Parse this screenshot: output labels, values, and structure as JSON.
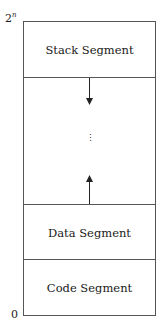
{
  "diagram": {
    "title": "",
    "axis": {
      "top_label_base": "2",
      "top_label_exp": "n",
      "bottom_label": "0"
    },
    "segments": [
      {
        "id": "stack",
        "label": "Stack Segment"
      },
      {
        "id": "free",
        "label": ""
      },
      {
        "id": "data",
        "label": "Data Segment"
      },
      {
        "id": "code",
        "label": "Code Segment"
      }
    ],
    "arrows": [
      {
        "from": "stack",
        "direction": "down"
      },
      {
        "from": "data",
        "direction": "up"
      }
    ],
    "gap_marker": "⋮",
    "colors": {
      "line": "#555555",
      "text": "#1a1a1a",
      "background": "#ffffff"
    }
  }
}
